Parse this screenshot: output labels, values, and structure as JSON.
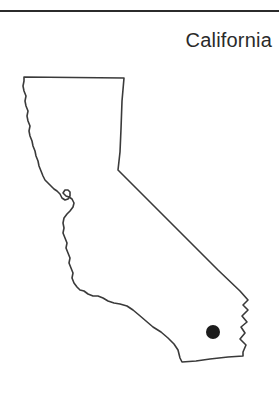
{
  "page": {
    "width": 279,
    "height": 404,
    "background_color": "#ffffff"
  },
  "header": {
    "rule_color": "#2b2b2b",
    "title": "California"
  },
  "map": {
    "region_name": "California",
    "outline_color": "#3a3a3a",
    "fill_color": "#ffffff",
    "marker": {
      "label": "location-dot",
      "color": "#1c1c1c",
      "x": 213,
      "y": 332,
      "radius": 7
    },
    "outline_path": "M 24,77 L 124,78 L 122,101 L 121,129 L 120,152 L 118,170 L 140,192 L 166,218 L 192,244 L 218,270 L 240,291 L 248,300 L 243,305 L 248,310 L 242,316 L 247,322 L 241,327 L 245,333 L 240,339 L 246,345 L 243,352 L 243,356 L 228,357 L 210,359 L 196,361 L 182,362 L 180,358 L 178,350 L 174,344 L 168,338 L 161,332 L 153,327 L 146,321 L 139,315 L 133,310 L 127,306 L 120,304 L 114,303 L 108,301 L 103,298 L 98,296 L 93,296 L 88,294 L 84,291 L 80,290 L 77,287 L 74,283 L 72,278 L 73,273 L 71,268 L 69,263 L 70,258 L 68,253 L 66,248 L 67,243 L 65,238 L 63,233 L 64,228 L 63,223 L 64,218 L 67,214 L 70,211 L 73,207 L 74,203 L 72,199 L 69,197 L 66,196 L 63,193 L 65,190 L 68,190 L 70,192 L 70,196 L 68,199 L 65,200 L 62,198 L 60,194 L 57,191 L 54,189 L 51,186 L 48,183 L 45,180 L 43,176 L 41,171 L 39,166 L 38,161 L 36,156 L 35,151 L 33,146 L 32,141 L 30,136 L 29,131 L 30,126 L 28,121 L 27,116 L 28,111 L 26,106 L 25,101 L 26,96 L 24,91 L 23,86 L 24,81 Z"
  }
}
